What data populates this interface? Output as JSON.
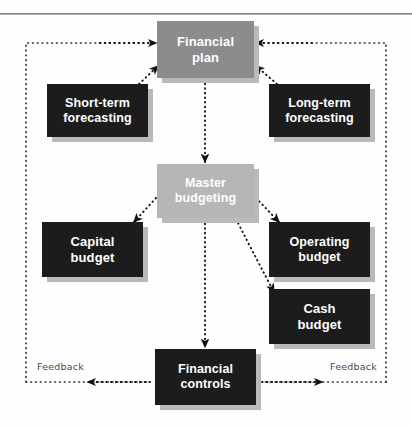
{
  "diagram": {
    "colors": {
      "dark_box": "#1c1c1c",
      "gray_box": "#8c8c8c",
      "light_gray_box": "#b6b6b6",
      "box_text": "#ffffff",
      "connector": "#1a1a1a",
      "frame": "#3a3a3a",
      "label_text": "#4a4a4a",
      "background": "#ffffff"
    },
    "nodes": [
      {
        "id": "financial-plan",
        "label": "Financial\nplan",
        "style": "gray",
        "x": 157,
        "y": 21,
        "w": 97,
        "h": 57
      },
      {
        "id": "short-term-forecasting",
        "label": "Short-term\nforecasting",
        "style": "dark",
        "x": 47,
        "y": 84,
        "w": 101,
        "h": 53
      },
      {
        "id": "long-term-forecasting",
        "label": "Long-term\nforecasting",
        "style": "dark",
        "x": 269,
        "y": 84,
        "w": 101,
        "h": 53
      },
      {
        "id": "master-budgeting",
        "label": "Master\nbudgeting",
        "style": "light-gray",
        "x": 157,
        "y": 164,
        "w": 97,
        "h": 54
      },
      {
        "id": "capital-budget",
        "label": "Capital\nbudget",
        "style": "dark",
        "x": 42,
        "y": 222,
        "w": 101,
        "h": 55
      },
      {
        "id": "operating-budget",
        "label": "Operating\nbudget",
        "style": "dark",
        "x": 269,
        "y": 222,
        "w": 101,
        "h": 55
      },
      {
        "id": "cash-budget",
        "label": "Cash\nbudget",
        "style": "dark",
        "x": 269,
        "y": 289,
        "w": 101,
        "h": 55
      },
      {
        "id": "financial-controls",
        "label": "Financial\ncontrols",
        "style": "dark",
        "x": 155,
        "y": 349,
        "w": 101,
        "h": 56
      }
    ],
    "edges": [
      {
        "id": "master-to-financial-plan-left",
        "from": "short-term-forecasting",
        "to": "financial-plan"
      },
      {
        "id": "master-to-financial-plan-right",
        "from": "long-term-forecasting",
        "to": "financial-plan"
      },
      {
        "id": "plan-to-master",
        "from": "financial-plan",
        "to": "master-budgeting"
      },
      {
        "id": "master-to-capital",
        "from": "master-budgeting",
        "to": "capital-budget"
      },
      {
        "id": "master-to-operating",
        "from": "master-budgeting",
        "to": "operating-budget"
      },
      {
        "id": "master-to-cash",
        "from": "master-budgeting",
        "to": "cash-budget"
      },
      {
        "id": "master-to-controls",
        "from": "master-budgeting",
        "to": "financial-controls"
      },
      {
        "id": "controls-to-left-feedback",
        "from": "financial-controls",
        "to": "financial-plan"
      },
      {
        "id": "controls-to-right-feedback",
        "from": "financial-controls",
        "to": "financial-plan"
      }
    ],
    "annotations": [
      {
        "id": "feedback-left",
        "text": "Feedback",
        "x": 37,
        "y": 361
      },
      {
        "id": "feedback-right",
        "text": "Feedback",
        "x": 330,
        "y": 361
      }
    ],
    "frame": {
      "left": 25,
      "top": 42,
      "right": 387,
      "bottom": 382
    }
  }
}
